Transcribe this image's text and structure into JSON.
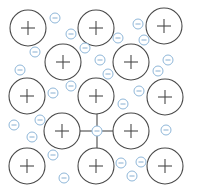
{
  "diagram": {
    "colors": {
      "ion_stroke": "#4a4a4a",
      "electron_stroke": "#8fb7d9",
      "background": "#ffffff"
    },
    "ion_radius": 18,
    "electron_radius": 5,
    "ions": [
      {
        "x": 28,
        "y": 28,
        "sign": "+"
      },
      {
        "x": 96,
        "y": 28,
        "sign": "+"
      },
      {
        "x": 164,
        "y": 26,
        "sign": "+"
      },
      {
        "x": 63,
        "y": 62,
        "sign": "+"
      },
      {
        "x": 131,
        "y": 62,
        "sign": "+"
      },
      {
        "x": 27,
        "y": 96,
        "sign": "+"
      },
      {
        "x": 96,
        "y": 96,
        "sign": "+"
      },
      {
        "x": 165,
        "y": 97,
        "sign": "+"
      },
      {
        "x": 62,
        "y": 131,
        "sign": "+"
      },
      {
        "x": 131,
        "y": 131,
        "sign": "+"
      },
      {
        "x": 27,
        "y": 166,
        "sign": "+"
      },
      {
        "x": 96,
        "y": 166,
        "sign": "+"
      },
      {
        "x": 165,
        "y": 166,
        "sign": "+"
      }
    ],
    "electrons": [
      {
        "x": 55,
        "y": 18,
        "sign": "−"
      },
      {
        "x": 35,
        "y": 52,
        "sign": "−"
      },
      {
        "x": 71,
        "y": 34,
        "sign": "−"
      },
      {
        "x": 85,
        "y": 48,
        "sign": "−"
      },
      {
        "x": 118,
        "y": 38,
        "sign": "−"
      },
      {
        "x": 100,
        "y": 60,
        "sign": "−"
      },
      {
        "x": 138,
        "y": 24,
        "sign": "−"
      },
      {
        "x": 144,
        "y": 40,
        "sign": "−"
      },
      {
        "x": 168,
        "y": 60,
        "sign": "−"
      },
      {
        "x": 20,
        "y": 70,
        "sign": "−"
      },
      {
        "x": 53,
        "y": 93,
        "sign": "−"
      },
      {
        "x": 71,
        "y": 86,
        "sign": "−"
      },
      {
        "x": 108,
        "y": 74,
        "sign": "−"
      },
      {
        "x": 158,
        "y": 71,
        "sign": "−"
      },
      {
        "x": 139,
        "y": 91,
        "sign": "−"
      },
      {
        "x": 123,
        "y": 104,
        "sign": "−"
      },
      {
        "x": 14,
        "y": 125,
        "sign": "−"
      },
      {
        "x": 40,
        "y": 120,
        "sign": "−"
      },
      {
        "x": 97,
        "y": 131,
        "sign": "−",
        "bonded": true
      },
      {
        "x": 166,
        "y": 130,
        "sign": "−"
      },
      {
        "x": 122,
        "y": 104,
        "sign": "−"
      },
      {
        "x": 32,
        "y": 137,
        "sign": "−"
      },
      {
        "x": 53,
        "y": 155,
        "sign": "−"
      },
      {
        "x": 64,
        "y": 178,
        "sign": "−"
      },
      {
        "x": 121,
        "y": 163,
        "sign": "−"
      },
      {
        "x": 141,
        "y": 162,
        "sign": "−"
      },
      {
        "x": 132,
        "y": 176,
        "sign": "−"
      },
      {
        "x": 96,
        "y": 131,
        "sign": "−"
      }
    ],
    "bonds": [
      {
        "x1": 80,
        "y1": 131,
        "x2": 92,
        "y2": 131
      },
      {
        "x1": 102,
        "y1": 131,
        "x2": 113,
        "y2": 131
      },
      {
        "x1": 97,
        "y1": 114,
        "x2": 97,
        "y2": 126
      },
      {
        "x1": 97,
        "y1": 136,
        "x2": 97,
        "y2": 148
      }
    ]
  }
}
